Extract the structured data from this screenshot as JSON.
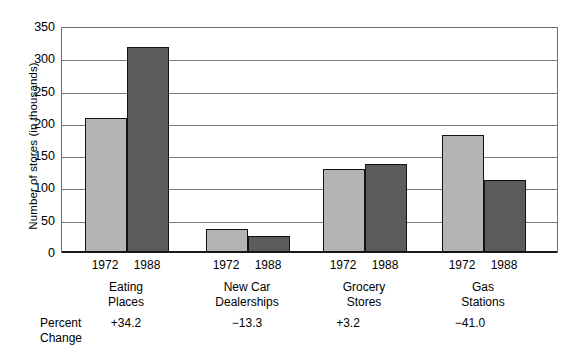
{
  "chart_data": {
    "type": "bar",
    "title": "",
    "xlabel": "",
    "ylabel": "Number of stores (in thousands)",
    "ylim": [
      0,
      350
    ],
    "yticks": [
      0,
      50,
      100,
      150,
      200,
      250,
      300,
      350
    ],
    "ytick_labels": [
      "0",
      "50",
      "100",
      "150",
      "200",
      "250",
      "300",
      "350"
    ],
    "grid": true,
    "legend": "none",
    "categories": [
      "Eating Places",
      "New Car Dealerships",
      "Grocery Stores",
      "Gas Stations"
    ],
    "category_lines": [
      [
        "Eating",
        "Places"
      ],
      [
        "New Car",
        "Dealerships"
      ],
      [
        "Grocery",
        "Stores"
      ],
      [
        "Gas",
        "Stations"
      ]
    ],
    "series": [
      {
        "name": "1972",
        "color": "#b4b4b4",
        "values": [
          207,
          36,
          128,
          181
        ]
      },
      {
        "name": "1988",
        "color": "#5c5c5c",
        "values": [
          318,
          25,
          136,
          111
        ]
      }
    ],
    "annotations": {
      "row_label_lines": [
        "Percent",
        "Change"
      ],
      "percent_change": [
        "+34.2",
        "−13.3",
        "+3.2",
        "−41.0"
      ]
    }
  },
  "axis": {
    "frame_color": "#6e6e6e",
    "gridline_color": "#7a7a7a",
    "baseline_color": "#1a1a1a",
    "bar_outline_color": "#131313"
  }
}
